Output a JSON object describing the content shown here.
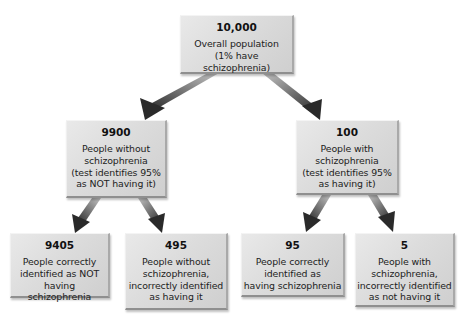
{
  "diagram": {
    "type": "probability-tree",
    "root": {
      "number": "10,000",
      "description": "Overall population\n(1% have schizophrenia)"
    },
    "level2": [
      {
        "number": "9900",
        "description": "People without\nschizophrenia\n(test identifies 95%\nas NOT having it)"
      },
      {
        "number": "100",
        "description": "People with\nschizophrenia\n(test identifies 95%\nas having it)"
      }
    ],
    "level3": [
      {
        "number": "9405",
        "description": "People correctly\nidentified as NOT\nhaving schizophrenia"
      },
      {
        "number": "495",
        "description": "People without\nschizophrenia,\nincorrectly identified\nas having it"
      },
      {
        "number": "95",
        "description": "People correctly\nidentified as\nhaving schizophrenia"
      },
      {
        "number": "5",
        "description": "People with\nschizophrenia,\nincorrectly identified\nas not having it"
      }
    ]
  },
  "colors": {
    "box_fill": "#dcdcdc",
    "arrow_dark": "#2a2a2a",
    "arrow_light": "#b0b0b0",
    "background": "#ffffff"
  }
}
